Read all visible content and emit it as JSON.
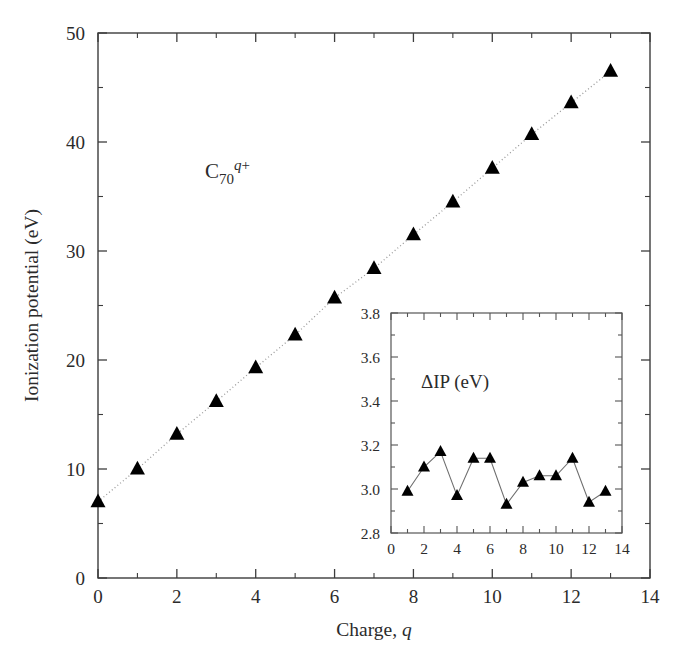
{
  "figure": {
    "background_color": "#ffffff",
    "marker_color": "#000000",
    "axis_color": "#3d3d3d",
    "trendline_color": "#9a9a9a"
  },
  "main": {
    "annotation": "C",
    "annotation_sub": "70",
    "annotation_sup": "q+",
    "xlabel_text": "Charge, ",
    "xlabel_italic": "q",
    "ylabel": "Ionization potential (eV)",
    "xticks": [
      "0",
      "2",
      "4",
      "6",
      "8",
      "10",
      "12",
      "14"
    ],
    "yticks": [
      "0",
      "10",
      "20",
      "30",
      "40",
      "50"
    ]
  },
  "inset": {
    "annotation": "ΔIP (eV)",
    "xticks": [
      "0",
      "2",
      "4",
      "6",
      "8",
      "10",
      "12",
      "14"
    ],
    "yticks": [
      "2.8",
      "3.0",
      "3.2",
      "3.4",
      "3.6",
      "3.8"
    ]
  },
  "chart_data": [
    {
      "type": "scatter",
      "id": "main-plot",
      "title": "",
      "annotation": "C70 q+",
      "xlabel": "Charge, q",
      "ylabel": "Ionization potential (eV)",
      "xlim": [
        0,
        14
      ],
      "ylim": [
        0,
        50
      ],
      "xticks": [
        0,
        2,
        4,
        6,
        8,
        10,
        12,
        14
      ],
      "yticks": [
        0,
        10,
        20,
        30,
        40,
        50
      ],
      "minor_tick_interval_x": 1,
      "minor_tick_interval_y": 5,
      "grid": false,
      "legend": false,
      "marker": "triangle-up",
      "marker_color": "#000000",
      "trendline": "dotted",
      "x": [
        0,
        1,
        2,
        3,
        4,
        5,
        6,
        7,
        8,
        9,
        10,
        11,
        12,
        13
      ],
      "y": [
        7.0,
        10.0,
        13.2,
        16.2,
        19.3,
        22.3,
        25.7,
        28.4,
        31.5,
        34.5,
        37.6,
        40.7,
        43.6,
        46.5
      ],
      "series": [
        {
          "name": "Ionization potential",
          "values": [
            7.0,
            10.0,
            13.2,
            16.2,
            19.3,
            22.3,
            25.7,
            28.4,
            31.5,
            34.5,
            37.6,
            40.7,
            43.6,
            46.5
          ]
        }
      ]
    },
    {
      "type": "line",
      "id": "inset-plot",
      "title": "",
      "annotation": "ΔIP (eV)",
      "xlabel": "",
      "ylabel": "",
      "xlim": [
        0,
        14
      ],
      "ylim": [
        2.8,
        3.8
      ],
      "xticks": [
        0,
        2,
        4,
        6,
        8,
        10,
        12,
        14
      ],
      "yticks": [
        2.8,
        3.0,
        3.2,
        3.4,
        3.6,
        3.8
      ],
      "minor_tick_interval_x": 1,
      "minor_tick_interval_y": 0.1,
      "grid": false,
      "legend": false,
      "marker": "triangle-up",
      "marker_color": "#000000",
      "x": [
        1,
        2,
        3,
        4,
        5,
        6,
        7,
        8,
        9,
        10,
        11,
        12,
        13
      ],
      "y": [
        2.99,
        3.1,
        3.17,
        2.97,
        3.14,
        3.14,
        2.93,
        3.03,
        3.06,
        3.06,
        3.14,
        2.94,
        2.99
      ],
      "series": [
        {
          "name": "ΔIP",
          "values": [
            2.99,
            3.1,
            3.17,
            2.97,
            3.14,
            3.14,
            2.93,
            3.03,
            3.06,
            3.06,
            3.14,
            2.94,
            2.99
          ]
        }
      ]
    }
  ]
}
